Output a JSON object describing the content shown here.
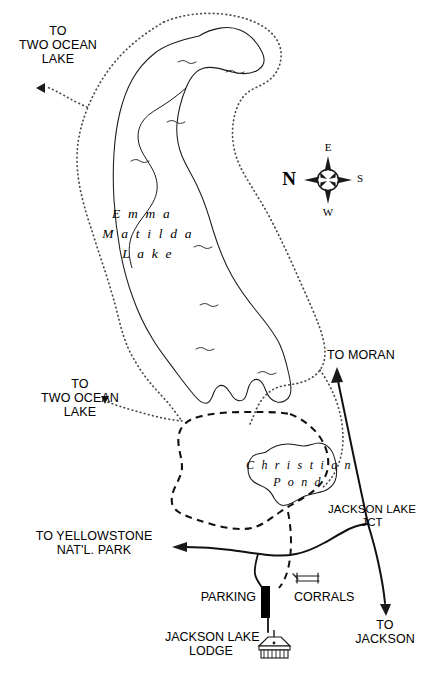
{
  "map": {
    "title": "Emma Matilda Lake / Christian Pond Area Trail Map",
    "background_color": "#ffffff",
    "ink_color": "#000000"
  },
  "water_features": [
    {
      "name": "Emma Matilda Lake",
      "label_lines": [
        "E m m a",
        "M a t i l d a",
        "L a k e"
      ]
    },
    {
      "name": "Christian Pond",
      "label_lines": [
        "C h r i s t i a n",
        "P o n d"
      ]
    }
  ],
  "labels": {
    "emma_matilda_line1": "E m m a",
    "emma_matilda_line2": "M a t i l d a",
    "emma_matilda_line3": "L a k e",
    "christian_pond_line1": "C h r i s t i a n",
    "christian_pond_line2": "P o n d",
    "two_ocean_north": "TO\nTWO OCEAN\nLAKE",
    "two_ocean_south": "TO\nTWO OCEAN\nLAKE",
    "to_moran": "TO MORAN",
    "to_yellowstone": "TO YELLOWSTONE\nNAT'L. PARK",
    "to_jackson": "TO\nJACKSON",
    "jackson_lake_jct": "JACKSON LAKE\nJCT",
    "parking": "PARKING",
    "corrals": "CORRALS",
    "jackson_lake_lodge": "JACKSON LAKE\nLODGE"
  },
  "compass": {
    "name": "compass-rose",
    "north": "N",
    "east": "E",
    "south": "S",
    "west": "W",
    "note": "N at left, E at top, S at right, W at bottom"
  },
  "legend_symbols": [
    {
      "name": "trail-dotted",
      "style": "dotted line",
      "meaning": "hiking trail"
    },
    {
      "name": "trail-dashed",
      "style": "dashed line",
      "meaning": "hiking trail loop"
    },
    {
      "name": "road-solid",
      "style": "solid line",
      "meaning": "paved road"
    },
    {
      "name": "parking-block",
      "style": "solid black rectangle",
      "meaning": "parking lot"
    },
    {
      "name": "lodge-building",
      "style": "building glyph",
      "meaning": "Jackson Lake Lodge"
    },
    {
      "name": "corral-fence",
      "style": "fence glyph",
      "meaning": "corrals"
    }
  ]
}
